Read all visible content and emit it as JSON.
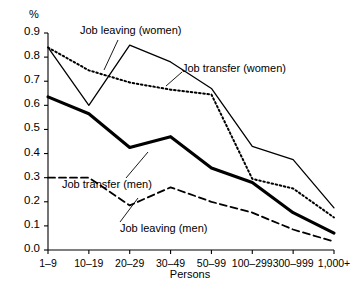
{
  "chart": {
    "type": "line",
    "unit_label": "%",
    "xlabel": "Persons",
    "ylabel": "",
    "title": ""
  },
  "chart_data": {
    "type": "line",
    "title": "",
    "xlabel": "Persons",
    "ylabel": "%",
    "ylim": [
      0.0,
      0.9
    ],
    "grid": false,
    "legend": "inline-annotations",
    "categories": [
      "1–9",
      "10–19",
      "20–29",
      "30–49",
      "50–99",
      "100–299",
      "300–999",
      "1,000+"
    ],
    "ytick_labels": [
      "0.0",
      "0.1",
      "0.2",
      "0.3",
      "0.4",
      "0.5",
      "0.6",
      "0.7",
      "0.8",
      "0.9"
    ],
    "ytick_values": [
      0.0,
      0.1,
      0.2,
      0.3,
      0.4,
      0.5,
      0.6,
      0.7,
      0.8,
      0.9
    ],
    "series": [
      {
        "name": "Job transfer (women)",
        "style": "solid-thin",
        "values": [
          0.84,
          0.6,
          0.85,
          0.78,
          0.67,
          0.43,
          0.375,
          0.175
        ]
      },
      {
        "name": "Job leaving (women)",
        "style": "dotted",
        "values": [
          0.84,
          0.745,
          0.695,
          0.665,
          0.645,
          0.295,
          0.255,
          0.135
        ]
      },
      {
        "name": "Job transfer (men)",
        "style": "solid-thick",
        "values": [
          0.635,
          0.565,
          0.425,
          0.47,
          0.34,
          0.28,
          0.155,
          0.07
        ]
      },
      {
        "name": "Job leaving (men)",
        "style": "dashed",
        "values": [
          0.3,
          0.3,
          0.185,
          0.26,
          0.2,
          0.155,
          0.085,
          0.035
        ]
      }
    ],
    "annotations": [
      {
        "text": "Job leaving (women)",
        "target_series": "Job leaving (women)"
      },
      {
        "text": "Job transfer (women)",
        "target_series": "Job transfer (women)"
      },
      {
        "text": "Job transfer (men)",
        "target_series": "Job transfer (men)"
      },
      {
        "text": "Job leaving (men)",
        "target_series": "Job leaving (men)"
      }
    ]
  }
}
